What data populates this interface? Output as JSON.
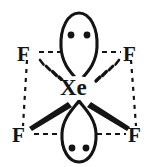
{
  "figure": {
    "central_atom": {
      "symbol": "Xe",
      "name": "xenon",
      "x": 77,
      "y": 88
    },
    "ligands": [
      {
        "symbol": "F",
        "name": "fluorine-top-left",
        "position": "top-left",
        "x": 26,
        "y": 55,
        "bond": "hashed-wedge"
      },
      {
        "symbol": "F",
        "name": "fluorine-top-right",
        "position": "top-right",
        "x": 132,
        "y": 55,
        "bond": "hashed-wedge"
      },
      {
        "symbol": "F",
        "name": "fluorine-bottom-left",
        "position": "bottom-left",
        "x": 22,
        "y": 136,
        "bond": "solid-wedge"
      },
      {
        "symbol": "F",
        "name": "fluorine-bottom-right",
        "position": "bottom-right",
        "x": 137,
        "y": 136,
        "bond": "solid-wedge"
      }
    ],
    "lone_pairs": [
      {
        "name": "lone-pair-top",
        "dots": 2,
        "orientation": "up"
      },
      {
        "name": "lone-pair-bottom",
        "dots": 2,
        "orientation": "down"
      }
    ],
    "geometry_outline": "dashed-square",
    "colors": {
      "ink": "#141414",
      "background": "#ffffff"
    }
  }
}
